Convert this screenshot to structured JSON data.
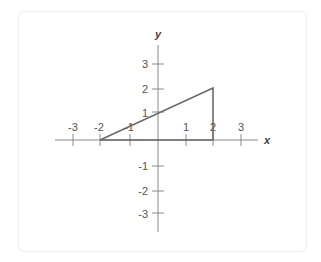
{
  "diagram": {
    "type": "coordinate-plane",
    "x_axis_label": "x",
    "y_axis_label": "y",
    "x_ticks": [
      "-3",
      "-2",
      "-1",
      "1",
      "2",
      "3"
    ],
    "y_ticks": [
      "3",
      "2",
      "1",
      "-1",
      "-2",
      "-3"
    ],
    "shape": {
      "name": "triangle",
      "vertices": [
        [
          -2,
          0
        ],
        [
          2,
          0
        ],
        [
          2,
          2
        ]
      ]
    },
    "colors": {
      "axis": "#8a8a8a",
      "shape": "#6a6a6a",
      "card_border": "#efefef"
    }
  }
}
